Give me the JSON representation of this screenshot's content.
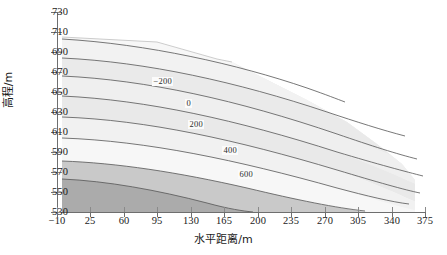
{
  "figure": {
    "background": "#ffffff",
    "frame_color": "#6e6e6e"
  },
  "chart_data": {
    "type": "heatmap",
    "subtype": "filled-contour",
    "title": "",
    "xlabel": "水平距离/m",
    "ylabel": "高程/m",
    "xlim": [
      -10,
      375
    ],
    "ylim": [
      530,
      730
    ],
    "xticks": [
      -10,
      25,
      60,
      95,
      130,
      165,
      200,
      235,
      270,
      305,
      340,
      375
    ],
    "yticks": [
      530,
      550,
      570,
      590,
      610,
      630,
      650,
      670,
      690,
      710,
      730
    ],
    "xtick_labels": [
      "−10",
      "25",
      "60",
      "95",
      "130",
      "165",
      "200",
      "235",
      "270",
      "305",
      "340",
      "375"
    ],
    "ytick_labels": [
      "530",
      "550",
      "570",
      "590",
      "610",
      "630",
      "650",
      "670",
      "690",
      "710",
      "730"
    ],
    "grid": false,
    "legend": null,
    "colormap": "gray",
    "contour_levels": [
      -800,
      -600,
      -400,
      -200,
      0,
      200,
      400,
      600,
      800
    ],
    "labeled_contours": [
      {
        "level": "−200",
        "x": 130,
        "y": 662
      },
      {
        "level": "0",
        "x": 162,
        "y": 639
      },
      {
        "level": "200",
        "x": 170,
        "y": 619
      },
      {
        "level": "400",
        "x": 203,
        "y": 592
      },
      {
        "level": "600",
        "x": 217,
        "y": 570
      }
    ],
    "fill_bands": [
      {
        "index": 0,
        "range": "below −800",
        "color": "#f4f4f4"
      },
      {
        "index": 1,
        "range": "−800 to −600",
        "color": "#efefef"
      },
      {
        "index": 2,
        "range": "−600 to −400",
        "color": "#f1f1f1"
      },
      {
        "index": 3,
        "range": "−400 to −200",
        "color": "#ebebeb"
      },
      {
        "index": 4,
        "range": "−200 to 0",
        "color": "#efefef"
      },
      {
        "index": 5,
        "range": "0 to 200",
        "color": "#e8e8e8"
      },
      {
        "index": 6,
        "range": "200 to 400",
        "color": "#efefef"
      },
      {
        "index": 7,
        "range": "400 to 600",
        "color": "#f6f6f6"
      },
      {
        "index": 8,
        "range": "600 to 800",
        "color": "#c8c8c8"
      },
      {
        "index": 9,
        "range": "above 800",
        "color": "#a9a9a9"
      }
    ],
    "contour_lines_left_edge_elevation": [
      697,
      678,
      660,
      640,
      619,
      598,
      575,
      557
    ],
    "domain_note": "wedge-shaped cross-section: full height at left edge, upper boundary descends to the right, data terminates near x=355"
  },
  "axis_titles": {
    "x": "水平距离/m",
    "y": "高程/m"
  }
}
